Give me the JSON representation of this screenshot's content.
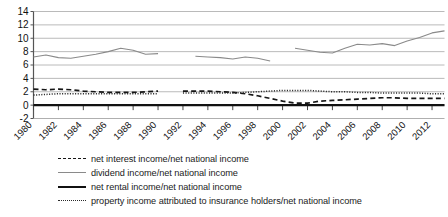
{
  "chart_data": {
    "type": "line",
    "title": "",
    "xlabel": "",
    "ylabel": "",
    "ylim": [
      -2,
      14
    ],
    "yticks": [
      -2,
      0,
      2,
      4,
      6,
      8,
      10,
      12,
      14
    ],
    "xlim": [
      1980,
      2013
    ],
    "xticks": [
      1980,
      1982,
      1984,
      1986,
      1988,
      1990,
      1992,
      1994,
      1996,
      1998,
      2000,
      2002,
      2004,
      2006,
      2008,
      2010,
      2012
    ],
    "xtick_labels": [
      "1980",
      "1982",
      "1984",
      "1986",
      "1988",
      "1990",
      "1992",
      "1994",
      "1996",
      "1998",
      "2000",
      "2002",
      "2004",
      "2006",
      "2008",
      "2010",
      "2012"
    ],
    "grid": "horizontal",
    "legend_position": "below",
    "x": [
      1980,
      1981,
      1982,
      1983,
      1984,
      1985,
      1986,
      1987,
      1988,
      1989,
      1990,
      1991,
      1992,
      1993,
      1994,
      1995,
      1996,
      1997,
      1998,
      1999,
      2000,
      2001,
      2002,
      2003,
      2004,
      2005,
      2006,
      2007,
      2008,
      2009,
      2010,
      2011,
      2012,
      2013
    ],
    "series": [
      {
        "name": "net interest income/net national income",
        "style": "dashed",
        "color": "#161616",
        "values": [
          2.4,
          2.3,
          2.4,
          2.3,
          2.1,
          2.0,
          1.9,
          1.9,
          1.9,
          2.0,
          2.1,
          null,
          2.1,
          2.1,
          2.1,
          2.0,
          1.9,
          1.7,
          1.4,
          1.0,
          0.6,
          0.3,
          0.3,
          0.6,
          0.7,
          0.8,
          0.9,
          1.0,
          1.1,
          1.1,
          1.0,
          1.0,
          1.0,
          1.0
        ]
      },
      {
        "name": "dividend income/net national income",
        "style": "solid-thin",
        "color": "#8a8a8a",
        "values": [
          7.2,
          7.5,
          7.1,
          7.0,
          7.3,
          7.6,
          8.0,
          8.5,
          8.2,
          7.6,
          7.7,
          null,
          null,
          7.3,
          7.2,
          7.1,
          6.9,
          7.2,
          7.0,
          6.6,
          null,
          8.5,
          8.2,
          7.9,
          7.8,
          8.5,
          9.1,
          9.0,
          9.2,
          8.9,
          9.6,
          10.1,
          10.8,
          11.1
        ]
      },
      {
        "name": "net rental income/net national income",
        "style": "solid-thick",
        "color": "#111111",
        "values": [
          0.0,
          0.0,
          0.0,
          0.0,
          0.0,
          0.0,
          0.0,
          0.0,
          0.0,
          0.0,
          0.0,
          0.0,
          0.0,
          0.0,
          0.0,
          0.0,
          0.0,
          0.0,
          0.0,
          0.0,
          0.0,
          0.0,
          0.0,
          0.0,
          0.0,
          0.0,
          0.0,
          0.0,
          0.0,
          0.0,
          0.0,
          0.0,
          0.0,
          0.0
        ]
      },
      {
        "name": "property income attributed to insurance holders/net national income",
        "style": "dotted",
        "color": "#2a2a2a",
        "values": [
          1.5,
          1.6,
          1.7,
          1.7,
          1.7,
          1.7,
          1.7,
          1.7,
          1.7,
          1.7,
          1.7,
          null,
          1.8,
          1.8,
          1.8,
          1.8,
          1.8,
          1.9,
          2.0,
          2.1,
          2.2,
          2.2,
          2.2,
          2.1,
          2.0,
          2.0,
          1.9,
          1.9,
          1.8,
          1.8,
          1.8,
          1.8,
          1.7,
          1.7
        ]
      }
    ],
    "dividend_segments": [
      {
        "from": 1980,
        "to": 1990,
        "values": [
          7.2,
          7.5,
          7.1,
          7.0,
          7.3,
          7.6,
          8.0,
          8.5,
          8.2,
          7.6,
          7.7
        ]
      },
      {
        "from": 1991,
        "to": 1999,
        "values": [
          7.6,
          7.5,
          7.3,
          7.2,
          7.1,
          6.9,
          7.2,
          7.0,
          6.6
        ]
      },
      {
        "from": 2000,
        "to": 2013,
        "values": [
          8.5,
          8.2,
          7.9,
          7.8,
          8.5,
          9.1,
          9.0,
          9.2,
          8.9,
          9.6,
          10.1,
          10.8,
          11.1,
          10.9
        ]
      }
    ]
  },
  "legend": {
    "items": [
      {
        "label": "net interest income/net national income",
        "style": "dashed"
      },
      {
        "label": "dividend income/net national income",
        "style": "solid-thin"
      },
      {
        "label": "net rental income/net national income",
        "style": "solid-thick"
      },
      {
        "label": "property income attributed to insurance holders/net national income",
        "style": "dotted"
      }
    ]
  }
}
